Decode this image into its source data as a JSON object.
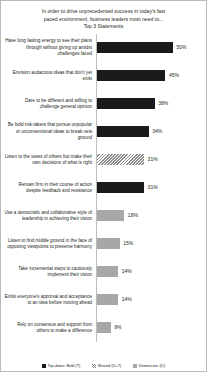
{
  "chart_data": {
    "type": "bar",
    "orientation": "horizontal",
    "title": "In order to drive unprecedented success in today's fast paced environment, business leaders most need to... Top 3 Statements",
    "title_lines": [
      "In order to drive unprecedented success in today's fast",
      "paced environment, business leaders most need to...",
      "Top 3 Statements"
    ],
    "xlabel": "",
    "ylabel": "",
    "grid": false,
    "xlim": [
      0,
      50
    ],
    "value_suffix": "%",
    "legend_position": "bottom",
    "categories": [
      "Have long lasting energy to see their plans through without giving up amidst challenges faced",
      "Envision audacious ideas that don't yet exist",
      "Dare to be different and willing to challenge  general opinion",
      "Be bold risk-takers  that pursue unpopular or unconventional ideas to break new ground",
      "Listen to the views of others but make their own decisions of what is right",
      "Remain firm in their course of action despite feedback and resistance",
      "Use a democratic and collaborative style of leadership  in achieving their vision",
      "Listen to find middle ground in the face of opposing viewpoints  to preserve harmony",
      "Take incremental steps to cautiously implement their vision",
      "Enlist everyone's approval and acceptance to an idea before moving ahead",
      "Rely on consensus and support from others to make a difference"
    ],
    "values": [
      50,
      45,
      38,
      34,
      31,
      31,
      18,
      15,
      14,
      14,
      9
    ],
    "value_labels": [
      "50%",
      "45%",
      "38%",
      "34%",
      "31%",
      "31%",
      "18%",
      "15%",
      "14%",
      "14%",
      "9%"
    ],
    "series_keys": [
      "topdown",
      "topdown",
      "topdown",
      "topdown",
      "shared",
      "topdown",
      "democratic",
      "democratic",
      "democratic",
      "democratic",
      "democratic"
    ],
    "legend": [
      {
        "key": "topdown",
        "label": "Top-down: Bold (T)",
        "color": "#1b1b1b"
      },
      {
        "key": "shared",
        "label": "Shared (D+T)",
        "color": "#b0b0b0"
      },
      {
        "key": "democratic",
        "label": "Democratic (D)",
        "color": "#a7a7a7"
      }
    ]
  }
}
